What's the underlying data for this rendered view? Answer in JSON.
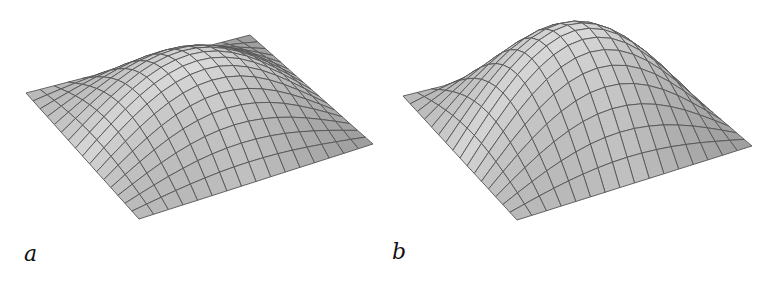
{
  "figure": {
    "panels": [
      {
        "id": "a",
        "label": "a",
        "grid_lines": 16,
        "mesh_color": "#555555",
        "surface_light": "#ececec",
        "surface_dark": "#9a9a9a",
        "corners": {
          "left": [
            26,
            93
          ],
          "front": [
            139,
            219
          ],
          "right": [
            373,
            144
          ],
          "back": [
            250,
            35
          ]
        },
        "peak_height": 62
      },
      {
        "id": "b",
        "label": "b",
        "grid_lines": 16,
        "mesh_color": "#555555",
        "surface_light": "#ececec",
        "surface_dark": "#9a9a9a",
        "corners": {
          "left": [
            23,
            96
          ],
          "front": [
            137,
            220
          ],
          "right": [
            372,
            146
          ],
          "back": [
            248,
            40
          ]
        },
        "peak_height": 95
      }
    ]
  }
}
